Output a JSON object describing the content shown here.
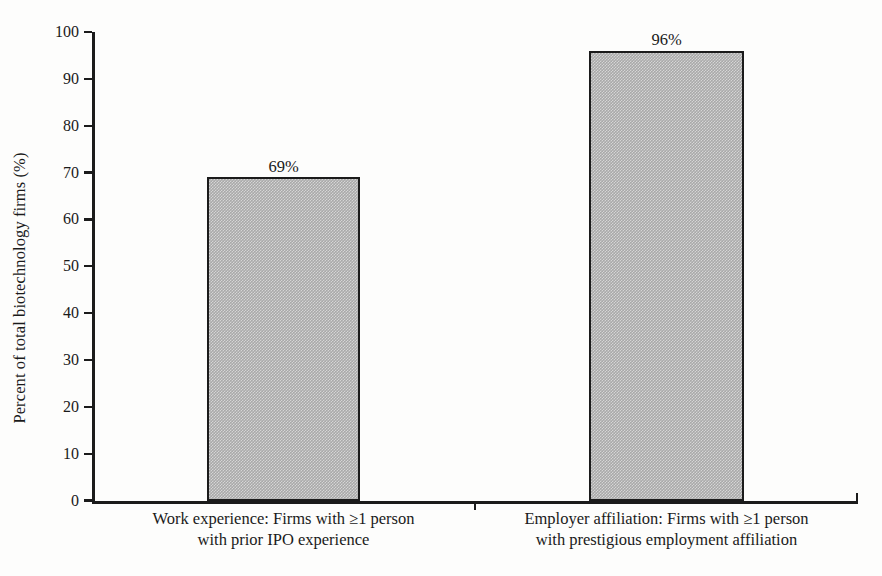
{
  "chart_data": {
    "type": "bar",
    "title": "",
    "subtitle": "",
    "xlabel": "",
    "ylabel": "Percent of total biotechnology firms (%)",
    "ylim": [
      0,
      100
    ],
    "ytick_values": [
      0,
      10,
      20,
      30,
      40,
      50,
      60,
      70,
      80,
      90,
      100
    ],
    "ytick_labels": [
      "0",
      "10",
      "20",
      "30",
      "40",
      "50",
      "60",
      "70",
      "80",
      "90",
      "100"
    ],
    "grid": false,
    "legend": null,
    "legend_position": "none",
    "bar_fill_color": "#a9a9a9",
    "bar_edge_color": "#1b1b1b",
    "axis_color": "#1b1b1b",
    "background_color": "#fdfdfc",
    "categories": [
      "Work experience:  Firms with ≥1 person with prior IPO experience",
      "Employer affiliation:  Firms with ≥1 person with prestigious employment affiliation"
    ],
    "values": [
      69,
      96
    ],
    "data_labels": [
      "69%",
      "96%"
    ],
    "bars": [
      {
        "category_line1": "Work experience:  Firms with ≥1 person",
        "category_line2": "with prior IPO experience",
        "value": 69,
        "data_label": "69%"
      },
      {
        "category_line1": "Employer affiliation:  Firms with ≥1 person",
        "category_line2": "with prestigious employment affiliation",
        "value": 96,
        "data_label": "96%"
      }
    ]
  }
}
